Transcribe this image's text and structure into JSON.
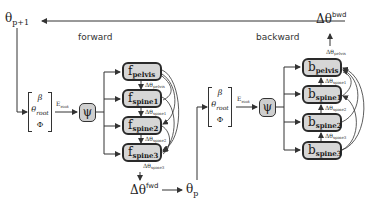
{
  "top": {
    "theta_next": {
      "base": "θ",
      "sub": "p+1"
    },
    "delta_bwd": {
      "base": "Δθ",
      "sup": "bwd"
    }
  },
  "forward": {
    "label": "forward",
    "input_vector": {
      "row1": "β",
      "row2_base": "θ",
      "row2_sub": "root",
      "row3": "Φ"
    },
    "edge_label": {
      "base": "E",
      "sub": "root"
    },
    "psi": "ψ",
    "nodes": [
      {
        "base": "f",
        "sub": "pelvis"
      },
      {
        "base": "f",
        "sub": "spine1"
      },
      {
        "base": "f",
        "sub": "spine2"
      },
      {
        "base": "f",
        "sub": "spine3"
      }
    ],
    "deltas": [
      {
        "base": "Δθ",
        "sub": "pelvis"
      },
      {
        "base": "Δθ",
        "sub": "spine1"
      },
      {
        "base": "Δθ",
        "sub": "spine2"
      },
      {
        "base": "Δθ",
        "sub": "spine3"
      }
    ],
    "output": {
      "base": "Δθ",
      "sup": "fwd"
    }
  },
  "middle": {
    "theta_p": {
      "base": "θ",
      "sub": "p"
    }
  },
  "backward": {
    "label": "backward",
    "input_vector": {
      "row1": "β",
      "row2_base": "θ",
      "row2_sub": "root",
      "row3": "Φ"
    },
    "edge_label": {
      "base": "E",
      "sub": "root"
    },
    "psi": "ψ",
    "nodes": [
      {
        "base": "b",
        "sub": "pelvis"
      },
      {
        "base": "b",
        "sub": "spine1"
      },
      {
        "base": "b",
        "sub": "spine2"
      },
      {
        "base": "b",
        "sub": "spine3"
      }
    ],
    "deltas": [
      {
        "base": "Δθ",
        "sub": "pelvis"
      },
      {
        "base": "Δθ",
        "sub": "spine1"
      },
      {
        "base": "Δθ",
        "sub": "spine2"
      },
      {
        "base": "Δθ",
        "sub": "spine3"
      }
    ]
  },
  "colors": {
    "node_fill": "#d6d6d6",
    "node_border": "#2a2a2a",
    "wire": "#333333"
  }
}
